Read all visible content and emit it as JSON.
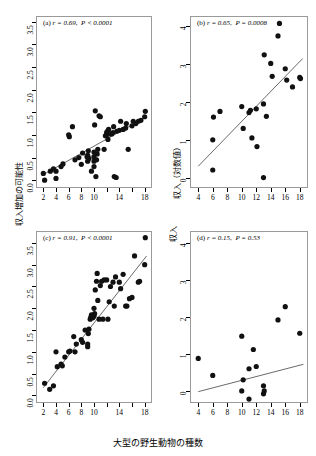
{
  "figure": {
    "xaxis_title": "大型の野生動物の種数",
    "left_yaxis_title": "収入増加の可能性",
    "right_yaxis_title_top": "収入（対数値）",
    "right_yaxis_title_bottom": "収入"
  },
  "chart_data": [
    {
      "type": "scatter",
      "panel": "a",
      "label": "(a)",
      "r_text": "r = 0.69,",
      "p_text": "P < 0.0001",
      "annotation": "(a) r = 0.69,  P < 0.0001",
      "r": 0.69,
      "p": 0.0001,
      "title": "",
      "xlabel": "大型の野生動物の種数",
      "ylabel": "収入増加の可能性",
      "xlim": [
        1,
        19
      ],
      "ylim": [
        -0.15,
        3.6
      ],
      "xticks": [
        2,
        4,
        6,
        8,
        10,
        12,
        14,
        16,
        18
      ],
      "xticklabels": [
        "2",
        "4",
        "6",
        "8",
        "10",
        "",
        "14",
        "",
        "18"
      ],
      "yticks": [
        0.0,
        0.5,
        1.0,
        1.5,
        2.0,
        2.5,
        3.0,
        3.5
      ],
      "yticklabels": [
        "0.0",
        "0.5",
        "1.0",
        "1.5",
        "2.0",
        "2.5",
        "3.0",
        "3.5"
      ],
      "grid": false,
      "fit_line": {
        "x": [
          2.2,
          18.3
        ],
        "y": [
          0.14,
          1.4
        ]
      },
      "x": [
        2.0,
        2.2,
        3.1,
        3.6,
        4.0,
        4.0,
        4.8,
        5.1,
        6.0,
        6.1,
        6.6,
        7.0,
        7.6,
        8.0,
        8.2,
        8.9,
        9.0,
        9.0,
        9.1,
        9.2,
        9.6,
        10.0,
        10.0,
        10.0,
        10.0,
        10.1,
        10.2,
        10.3,
        10.4,
        10.5,
        10.6,
        10.8,
        11.0,
        11.6,
        11.8,
        12.0,
        12.0,
        12.1,
        12.2,
        12.3,
        12.5,
        12.8,
        13.0,
        13.1,
        13.2,
        13.5,
        13.6,
        14.0,
        14.2,
        14.6,
        15.0,
        15.1,
        15.4,
        16.0,
        16.2,
        16.6,
        17.0,
        17.4,
        18.0,
        18.1
      ],
      "y": [
        0.15,
        0.0,
        0.2,
        0.25,
        0.04,
        0.2,
        0.3,
        0.36,
        1.0,
        0.96,
        1.18,
        0.45,
        0.5,
        0.35,
        0.6,
        0.52,
        0.42,
        0.55,
        0.65,
        0.48,
        0.2,
        0.3,
        0.42,
        0.52,
        0.62,
        1.22,
        1.53,
        0.08,
        0.45,
        0.58,
        0.68,
        1.42,
        1.4,
        0.68,
        0.98,
        1.0,
        1.05,
        1.08,
        0.9,
        1.12,
        1.02,
        1.02,
        1.05,
        1.18,
        0.08,
        0.06,
        1.08,
        1.1,
        1.3,
        1.12,
        1.15,
        1.25,
        0.68,
        1.2,
        1.3,
        1.25,
        1.3,
        1.32,
        1.4,
        1.52
      ]
    },
    {
      "type": "scatter",
      "panel": "b",
      "label": "(b)",
      "r_text": "r = 0.65,",
      "p_text": "P = 0.0008",
      "annotation": "(b) r = 0.65,  P = 0.0008",
      "r": 0.65,
      "p": 0.0008,
      "title": "",
      "xlabel": "大型の野生動物の種数",
      "ylabel": "収入（対数値）",
      "xlim": [
        3,
        19
      ],
      "ylim": [
        -0.25,
        4.25
      ],
      "xticks": [
        4,
        6,
        8,
        10,
        12,
        14,
        16,
        18
      ],
      "xticklabels": [
        "4",
        "6",
        "8",
        "10",
        "12",
        "14",
        "16",
        "18"
      ],
      "yticks": [
        0,
        1,
        2,
        3,
        4
      ],
      "yticklabels": [
        "0",
        "1",
        "2",
        "3",
        "4"
      ],
      "grid": false,
      "fit_line": {
        "x": [
          4.0,
          18.4
        ],
        "y": [
          0.3,
          3.15
        ]
      },
      "x": [
        6.0,
        6.0,
        6.1,
        7.0,
        10.0,
        10.2,
        11.0,
        11.2,
        11.4,
        12.0,
        12.1,
        13.0,
        13.0,
        13.1,
        13.4,
        14.0,
        14.2,
        15.0,
        15.2,
        16.0,
        16.2,
        17.0,
        18.0,
        18.1
      ],
      "y": [
        0.2,
        1.0,
        1.6,
        1.75,
        1.88,
        1.3,
        1.72,
        1.78,
        1.05,
        1.82,
        0.82,
        1.95,
        0.0,
        3.25,
        1.62,
        3.02,
        2.68,
        3.75,
        4.08,
        2.88,
        2.58,
        2.4,
        2.65,
        2.62
      ]
    },
    {
      "type": "scatter",
      "panel": "c",
      "label": "(c)",
      "r_text": "r = 0.91,",
      "p_text": "P < 0.0001",
      "annotation": "(c) r = 0.91,  P < 0.0001",
      "r": 0.91,
      "p": 0.0001,
      "title": "",
      "xlabel": "大型の野生動物の種数",
      "ylabel": "収入増加の可能性",
      "xlim": [
        1,
        19
      ],
      "ylim": [
        -0.15,
        3.75
      ],
      "xticks": [
        2,
        4,
        6,
        8,
        10,
        12,
        14,
        16,
        18
      ],
      "xticklabels": [
        "2",
        "4",
        "6",
        "8",
        "10",
        "",
        "14",
        "",
        "18"
      ],
      "yticks": [
        0.0,
        0.5,
        1.0,
        1.5,
        2.0,
        2.5,
        3.0,
        3.5
      ],
      "yticklabels": [
        "0.0",
        "0.5",
        "1.0",
        "1.5",
        "2.0",
        "2.5",
        "3.0",
        "3.5"
      ],
      "grid": false,
      "fit_line": {
        "x": [
          2.0,
          18.3
        ],
        "y": [
          0.18,
          3.2
        ]
      },
      "x": [
        2.2,
        3.0,
        3.6,
        4.0,
        4.2,
        4.8,
        5.0,
        5.4,
        6.0,
        6.2,
        6.8,
        7.0,
        7.2,
        8.0,
        8.2,
        8.6,
        9.0,
        9.0,
        9.1,
        9.2,
        9.4,
        9.5,
        9.6,
        9.8,
        10.0,
        10.0,
        10.1,
        10.2,
        10.4,
        10.5,
        10.6,
        10.8,
        11.0,
        11.2,
        11.4,
        11.6,
        12.0,
        12.2,
        12.4,
        12.6,
        13.0,
        13.2,
        13.4,
        14.0,
        14.2,
        14.6,
        15.0,
        15.2,
        15.6,
        16.0,
        16.4,
        17.0,
        17.2,
        18.0,
        18.1
      ],
      "y": [
        0.28,
        0.14,
        0.22,
        1.0,
        0.66,
        0.72,
        0.68,
        0.88,
        1.0,
        1.02,
        1.35,
        1.0,
        1.18,
        1.28,
        1.22,
        1.5,
        1.18,
        1.12,
        1.42,
        1.52,
        1.75,
        1.8,
        1.85,
        1.78,
        1.82,
        2.0,
        1.88,
        2.42,
        2.62,
        2.8,
        2.18,
        1.75,
        2.52,
        2.62,
        1.75,
        2.65,
        2.65,
        1.75,
        2.15,
        2.5,
        2.6,
        2.05,
        2.72,
        2.6,
        2.45,
        2.78,
        2.05,
        2.05,
        2.22,
        2.25,
        3.2,
        2.6,
        2.62,
        3.0,
        3.62
      ]
    },
    {
      "type": "scatter",
      "panel": "d",
      "label": "(d)",
      "r_text": "r = 0.15,",
      "p_text": "P = 0.53",
      "annotation": "(d) r = 0.15,  P = 0.53",
      "r": 0.15,
      "p": 0.53,
      "title": "",
      "xlabel": "大型の野生動物の種数",
      "ylabel": "収入",
      "xlim": [
        3,
        19
      ],
      "ylim": [
        -0.3,
        4.3
      ],
      "xticks": [
        4,
        6,
        8,
        10,
        12,
        14,
        16,
        18
      ],
      "xticklabels": [
        "4",
        "6",
        "8",
        "10",
        "12",
        "14",
        "16",
        "18"
      ],
      "yticks": [
        0,
        1,
        2,
        3,
        4
      ],
      "yticklabels": [
        "0",
        "1",
        "2",
        "3",
        "4"
      ],
      "grid": false,
      "fit_line": {
        "x": [
          4.0,
          18.5
        ],
        "y": [
          -0.02,
          0.72
        ]
      },
      "x": [
        4.0,
        6.0,
        10.0,
        10.0,
        10.2,
        11.0,
        11.0,
        11.6,
        12.0,
        13.0,
        13.0,
        13.1,
        15.0,
        16.0,
        18.0
      ],
      "y": [
        0.88,
        0.42,
        1.48,
        0.0,
        0.3,
        0.6,
        -0.22,
        1.12,
        0.66,
        0.14,
        -0.08,
        0.0,
        1.92,
        2.28,
        1.56
      ]
    }
  ]
}
